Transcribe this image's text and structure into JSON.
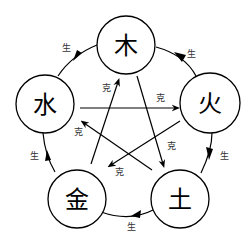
{
  "diagram": {
    "type": "wu-xing-five-elements-cycle",
    "elements": [
      {
        "id": "wood",
        "char": "木",
        "cx": 126,
        "cy": 45
      },
      {
        "id": "fire",
        "char": "火",
        "cx": 210,
        "cy": 103
      },
      {
        "id": "earth",
        "char": "土",
        "cx": 180,
        "cy": 199
      },
      {
        "id": "metal",
        "char": "金",
        "cx": 77,
        "cy": 199
      },
      {
        "id": "water",
        "char": "水",
        "cx": 45,
        "cy": 104
      }
    ],
    "generating_label": "生",
    "overcoming_label": "克",
    "generating_cycle": [
      {
        "from": "wood",
        "to": "fire",
        "label": "生"
      },
      {
        "from": "fire",
        "to": "earth",
        "label": "生"
      },
      {
        "from": "earth",
        "to": "metal",
        "label": "生"
      },
      {
        "from": "metal",
        "to": "water",
        "label": "生"
      },
      {
        "from": "water",
        "to": "wood",
        "label": "生"
      }
    ],
    "overcoming_cycle": [
      {
        "from": "wood",
        "to": "earth",
        "label": "克"
      },
      {
        "from": "earth",
        "to": "water",
        "label": "克"
      },
      {
        "from": "water",
        "to": "fire",
        "label": "克"
      },
      {
        "from": "fire",
        "to": "metal",
        "label": "克"
      },
      {
        "from": "metal",
        "to": "wood",
        "label": "克"
      }
    ]
  }
}
